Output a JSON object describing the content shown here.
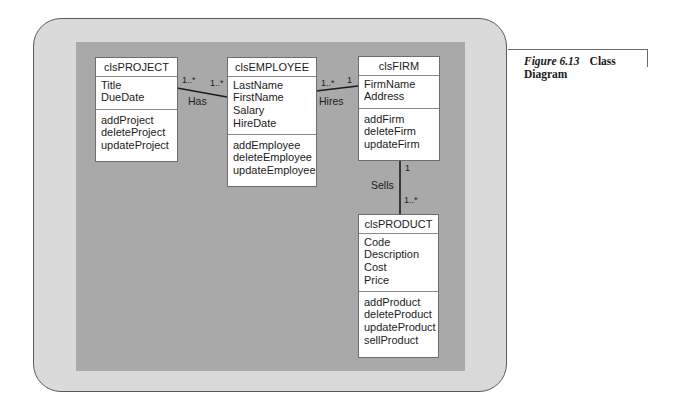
{
  "caption": {
    "figure_label": "Figure 6.13",
    "title_line1": "Class",
    "title_line2": "Diagram"
  },
  "classes": {
    "project": {
      "name": "clsPROJECT",
      "attributes": [
        "Title",
        "DueDate"
      ],
      "operations": [
        "addProject",
        "deleteProject",
        "updateProject"
      ]
    },
    "employee": {
      "name": "clsEMPLOYEE",
      "attributes": [
        "LastName",
        "FirstName",
        "Salary",
        "HireDate"
      ],
      "operations": [
        "addEmployee",
        "deleteEmployee",
        "updateEmployee"
      ]
    },
    "firm": {
      "name": "clsFIRM",
      "attributes": [
        "FirmName",
        "Address"
      ],
      "operations": [
        "addFirm",
        "deleteFirm",
        "updateFirm"
      ]
    },
    "product": {
      "name": "clsPRODUCT",
      "attributes": [
        "Code",
        "Description",
        "Cost",
        "Price"
      ],
      "operations": [
        "addProduct",
        "deleteProduct",
        "updateProduct",
        "sellProduct"
      ]
    }
  },
  "associations": {
    "has": {
      "label": "Has",
      "from_mult": "1..*",
      "to_mult": "1..*"
    },
    "hires": {
      "label": "Hires",
      "from_mult": "1..*",
      "to_mult": "1"
    },
    "sells": {
      "label": "Sells",
      "from_mult": "1",
      "to_mult": "1..*"
    }
  },
  "colors": {
    "outer_panel": "#dadada",
    "inner_panel": "#a9a9a9",
    "box": "#ffffff",
    "line": "#1c1c1c"
  }
}
